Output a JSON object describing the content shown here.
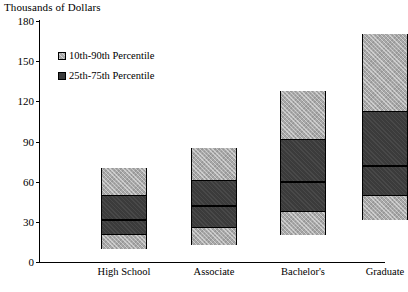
{
  "chart_data": {
    "type": "bar",
    "title": "Thousands of Dollars",
    "subtitle": "",
    "xlabel": "",
    "ylabel": "Thousands of Dollars",
    "ylim": [
      0,
      180
    ],
    "yticks": [
      0,
      30,
      60,
      90,
      120,
      150,
      180
    ],
    "grid": false,
    "legend_position": "inside-upper-left",
    "categories": [
      "High School",
      "Associate",
      "Bachelor's",
      "Graduate"
    ],
    "series": [
      {
        "name": "10th Percentile",
        "values": [
          10,
          13,
          20,
          31
        ]
      },
      {
        "name": "25th Percentile",
        "values": [
          21,
          26,
          38,
          50
        ]
      },
      {
        "name": "Median (50th Percentile)",
        "values": [
          31,
          42,
          60,
          72
        ]
      },
      {
        "name": "75th Percentile",
        "values": [
          50,
          61,
          92,
          113
        ]
      },
      {
        "name": "90th Percentile",
        "values": [
          70,
          85,
          128,
          170
        ]
      }
    ],
    "legend": [
      {
        "label": "10th-90th Percentile",
        "swatch": "light"
      },
      {
        "label": "25th-75th Percentile",
        "swatch": "dark"
      }
    ]
  },
  "axis": {
    "title": "Thousands of Dollars",
    "tick_180": "180",
    "tick_150": "150",
    "tick_120": "120",
    "tick_90": "90",
    "tick_60": "60",
    "tick_30": "30",
    "tick_0": "0"
  },
  "categories": {
    "c0": "High School",
    "c1": "Associate",
    "c2": "Bachelor's",
    "c3": "Graduate"
  },
  "legend": {
    "row0": "10th-90th Percentile",
    "row1": "25th-75th Percentile"
  }
}
